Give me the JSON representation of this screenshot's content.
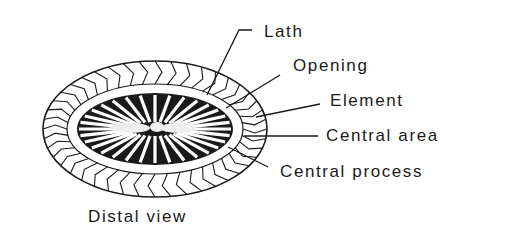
{
  "diagram": {
    "view_caption": "Distal view",
    "labels": {
      "lath": "Lath",
      "opening": "Opening",
      "element": "Element",
      "central_area": "Central area",
      "central_process": "Central process"
    },
    "colors": {
      "ink": "#1a1a1a",
      "background": "#ffffff"
    }
  }
}
